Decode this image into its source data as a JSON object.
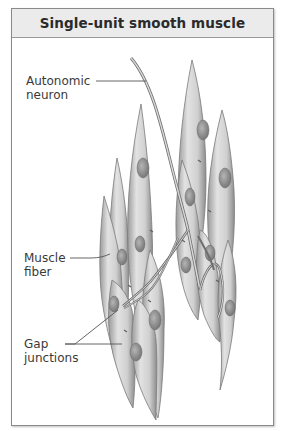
{
  "figure": {
    "title": "Single-unit smooth muscle",
    "labels": [
      {
        "id": "autonomic-neuron",
        "line1": "Autonomic",
        "line2": "neuron"
      },
      {
        "id": "muscle-fiber",
        "line1": "Muscle",
        "line2": "fiber"
      },
      {
        "id": "gap-junctions",
        "line1": "Gap",
        "line2": "junctions"
      }
    ],
    "colors": {
      "header_bg": "#ebebeb",
      "border": "#8a8a8a",
      "cell_fill": "#d4d4d4",
      "cell_edge": "#7a7a7a",
      "nucleus": "#8e8e8e",
      "leader_line": "#555555"
    }
  }
}
